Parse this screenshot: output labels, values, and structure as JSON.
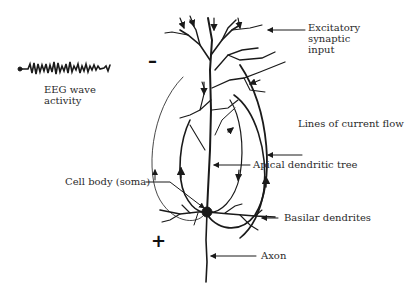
{
  "diagram": {
    "type": "neuron-eeg-dipole",
    "labels": {
      "excitatory": [
        "Excitatory",
        "synaptic",
        "input"
      ],
      "eeg": [
        "EEG wave",
        "activity"
      ],
      "current_flow": "Lines of current flow",
      "apical": "Apical dendritic tree",
      "soma": "Cell body (soma)",
      "basilar": "Basilar dendrites",
      "axon": "Axon"
    },
    "signs": {
      "negative": "–",
      "positive": "+"
    },
    "colors": {
      "ink": "#1a1a1a",
      "background": "#ffffff"
    }
  }
}
